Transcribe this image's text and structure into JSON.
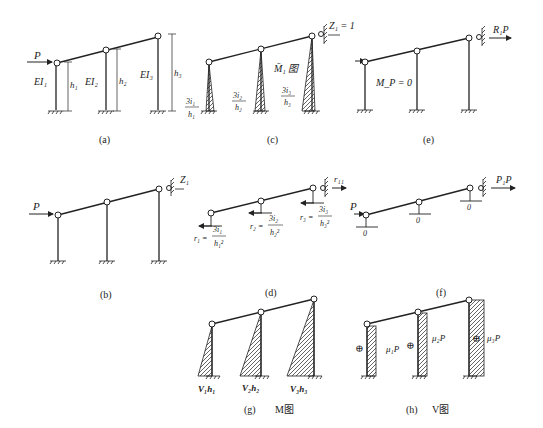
{
  "panels": {
    "a": {
      "caption": "(a)",
      "load": "P",
      "columns": [
        {
          "stiffness": "EI₁",
          "height": "h₁"
        },
        {
          "stiffness": "EI₂",
          "height": "h₂"
        },
        {
          "stiffness": "EI₃",
          "height": "h₃"
        }
      ]
    },
    "b": {
      "caption": "(b)",
      "load": "P",
      "unknown": "Z₁"
    },
    "c": {
      "caption": "(c)",
      "unit_disp": "Z₁ = 1",
      "diagram_title": "M̄₁ 图",
      "values": [
        {
          "num": "3i₁",
          "den": "h₁"
        },
        {
          "num": "3i₂",
          "den": "h₂"
        },
        {
          "num": "3i₃",
          "den": "h₃"
        }
      ]
    },
    "d": {
      "caption": "(d)",
      "reaction": "r₁₁",
      "shears": [
        {
          "lhs": "r₁ =",
          "num": "3i₁",
          "den": "h₁²"
        },
        {
          "lhs": "r₂ =",
          "num": "3i₂",
          "den": "h₂²"
        },
        {
          "lhs": "r₃ =",
          "num": "3i₃",
          "den": "h₃²"
        }
      ]
    },
    "e": {
      "caption": "(e)",
      "moment": "M_P = 0",
      "reaction": "R₁P"
    },
    "f": {
      "caption": "(f)",
      "load": "P",
      "reaction": "P₁P",
      "shears": [
        "0",
        "0",
        "0"
      ]
    },
    "g": {
      "caption": "(g)",
      "title": "M图",
      "values": [
        "V₁h₁",
        "V₂h₂",
        "V₃h₃"
      ]
    },
    "h": {
      "caption": "(h)",
      "title": "V图",
      "sign": "⊕",
      "values": [
        "μ₁P",
        "μ₂P",
        "μ₃P"
      ]
    }
  }
}
